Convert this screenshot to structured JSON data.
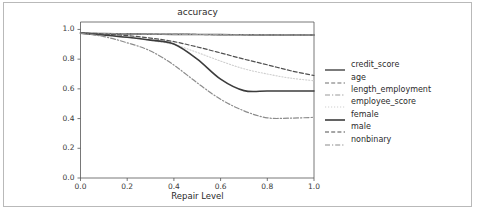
{
  "figure": {
    "title": "accuracy",
    "xlabel": "Repair Level",
    "ylabel": ""
  },
  "axes": {
    "xticks": [
      "0.0",
      "0.2",
      "0.4",
      "0.6",
      "0.8",
      "1.0"
    ],
    "yticks": [
      "0.0",
      "0.2",
      "0.4",
      "0.6",
      "0.8",
      "1.0"
    ]
  },
  "legend": {
    "entries": [
      {
        "label": "credit_score",
        "style": "solid",
        "color": "#5a5a5a",
        "width": 1.6
      },
      {
        "label": "age",
        "style": "dashed",
        "color": "#6e6e6e",
        "width": 1.2
      },
      {
        "label": "length_employment",
        "style": "dashdot",
        "color": "#9a9a9a",
        "width": 1.1
      },
      {
        "label": "employee_score",
        "style": "dotted",
        "color": "#cfcfcf",
        "width": 1.1
      },
      {
        "label": "female",
        "style": "solid",
        "color": "#3c3c3c",
        "width": 1.6
      },
      {
        "label": "male",
        "style": "dashed",
        "color": "#4f4f4f",
        "width": 1.2
      },
      {
        "label": "nonbinary",
        "style": "dashdot",
        "color": "#8c8c8c",
        "width": 1.2
      }
    ]
  },
  "chart_data": {
    "type": "line",
    "title": "accuracy",
    "xlabel": "Repair Level",
    "ylabel": "",
    "xlim": [
      0.0,
      1.0
    ],
    "ylim": [
      0.0,
      1.05
    ],
    "grid": false,
    "legend_position": "right-outside",
    "x": [
      0.0,
      0.1,
      0.2,
      0.3,
      0.4,
      0.5,
      0.6,
      0.7,
      0.8,
      0.9,
      1.0
    ],
    "series": [
      {
        "name": "credit_score",
        "values": [
          0.975,
          0.972,
          0.97,
          0.968,
          0.967,
          0.966,
          0.965,
          0.964,
          0.963,
          0.963,
          0.962
        ]
      },
      {
        "name": "age",
        "values": [
          0.975,
          0.972,
          0.97,
          0.968,
          0.967,
          0.966,
          0.965,
          0.964,
          0.963,
          0.963,
          0.962
        ]
      },
      {
        "name": "length_employment",
        "values": [
          0.975,
          0.972,
          0.97,
          0.968,
          0.967,
          0.966,
          0.965,
          0.964,
          0.963,
          0.963,
          0.962
        ]
      },
      {
        "name": "employee_score",
        "values": [
          0.975,
          0.963,
          0.948,
          0.925,
          0.898,
          0.845,
          0.787,
          0.735,
          0.7,
          0.672,
          0.655
        ]
      },
      {
        "name": "female",
        "values": [
          0.975,
          0.962,
          0.947,
          0.928,
          0.902,
          0.8,
          0.665,
          0.588,
          0.586,
          0.586,
          0.586
        ]
      },
      {
        "name": "male",
        "values": [
          0.975,
          0.968,
          0.958,
          0.942,
          0.918,
          0.882,
          0.842,
          0.8,
          0.762,
          0.722,
          0.69
        ]
      },
      {
        "name": "nonbinary",
        "values": [
          0.975,
          0.952,
          0.91,
          0.855,
          0.76,
          0.64,
          0.53,
          0.452,
          0.405,
          0.403,
          0.408
        ]
      }
    ]
  }
}
